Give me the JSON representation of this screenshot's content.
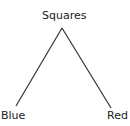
{
  "diagram": {
    "type": "tree",
    "root": {
      "label": "Squares"
    },
    "children": [
      {
        "label": "Blue"
      },
      {
        "label": "Red"
      }
    ],
    "edge_color": "#333333",
    "text_color": "#222222"
  }
}
